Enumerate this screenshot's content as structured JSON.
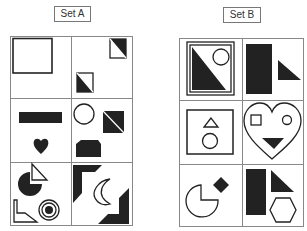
{
  "sets": [
    {
      "label": "Set A",
      "cells": [
        {
          "row": 1,
          "col": 1,
          "shapes": [
            "outline-square"
          ]
        },
        {
          "row": 1,
          "col": 2,
          "shapes": [
            "half-black-square-diagonal",
            "half-black-square-diagonal"
          ]
        },
        {
          "row": 2,
          "col": 1,
          "shapes": [
            "black-rectangle",
            "black-heart"
          ]
        },
        {
          "row": 2,
          "col": 2,
          "shapes": [
            "outline-circle",
            "half-black-square-diagonal",
            "black-rounded-rectangle"
          ]
        },
        {
          "row": 3,
          "col": 1,
          "shapes": [
            "black-pie-circle",
            "outline-triangle",
            "outline-l-shape",
            "concentric-circles"
          ]
        },
        {
          "row": 3,
          "col": 2,
          "shapes": [
            "black-corner-bracket",
            "outline-crescent",
            "black-corner-bracket"
          ]
        }
      ]
    },
    {
      "label": "Set B",
      "cells": [
        {
          "row": 1,
          "col": 1,
          "shapes": [
            "framed-square",
            "black-triangle",
            "outline-circle"
          ]
        },
        {
          "row": 1,
          "col": 2,
          "shapes": [
            "black-rectangle",
            "black-triangle"
          ]
        },
        {
          "row": 2,
          "col": 1,
          "shapes": [
            "outline-square",
            "outline-triangle",
            "outline-circle"
          ]
        },
        {
          "row": 2,
          "col": 2,
          "shapes": [
            "outline-heart",
            "outline-square",
            "outline-circle",
            "black-triangle"
          ]
        },
        {
          "row": 3,
          "col": 1,
          "shapes": [
            "outline-pie-circle",
            "black-diamond"
          ]
        },
        {
          "row": 3,
          "col": 2,
          "shapes": [
            "black-rectangle",
            "black-triangle",
            "outline-hexagon"
          ]
        }
      ]
    }
  ],
  "colors": {
    "ink": "#222222",
    "grid": "#888888",
    "background": "#ffffff"
  }
}
